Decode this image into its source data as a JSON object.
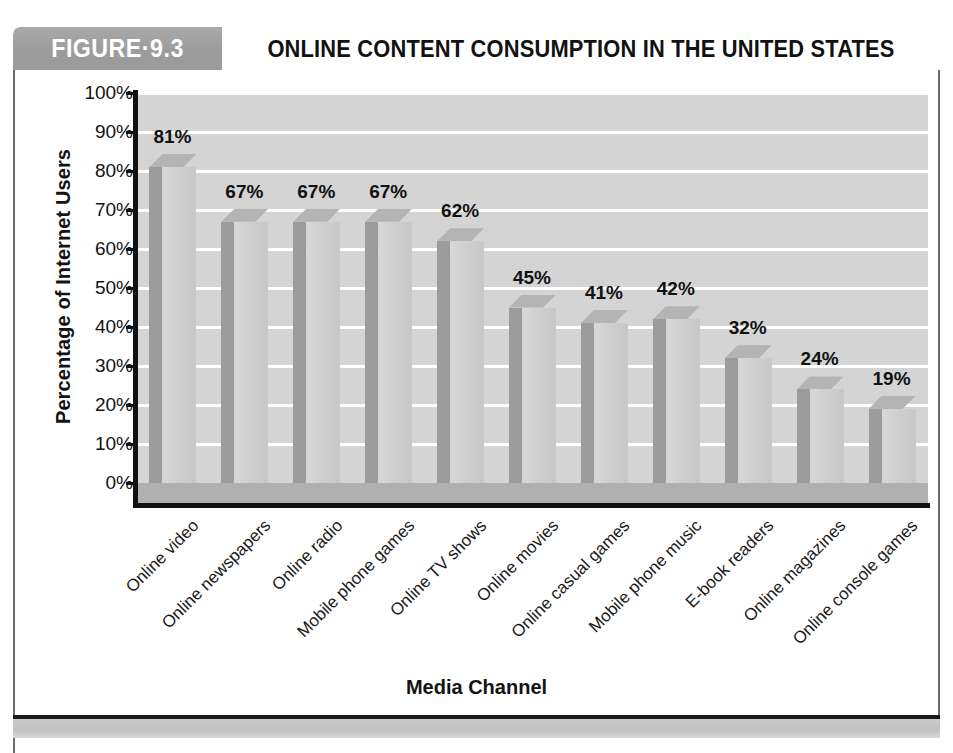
{
  "figure": {
    "number_label": "FIGURE·9.3",
    "title": "ONLINE CONTENT CONSUMPTION IN THE UNITED STATES"
  },
  "chart_data": {
    "type": "bar",
    "title": "ONLINE CONTENT CONSUMPTION IN THE UNITED STATES",
    "xlabel": "Media Channel",
    "ylabel": "Percentage of Internet Users",
    "ylim": [
      0,
      100
    ],
    "ytick_labels": [
      "100%",
      "90%",
      "80%",
      "70%",
      "60%",
      "50%",
      "40%",
      "30%",
      "20%",
      "10%",
      "0%"
    ],
    "ytick_values": [
      100,
      90,
      80,
      70,
      60,
      50,
      40,
      30,
      20,
      10,
      0
    ],
    "grid": true,
    "legend": false,
    "value_suffix": "%",
    "categories": [
      "Online video",
      "Online newspapers",
      "Online radio",
      "Mobile phone games",
      "Online TV shows",
      "Online movies",
      "Online casual games",
      "Mobile phone music",
      "E-book readers",
      "Online magazines",
      "Online console games"
    ],
    "values": [
      81,
      67,
      67,
      67,
      62,
      45,
      41,
      42,
      32,
      24,
      19
    ],
    "data_labels": [
      "81%",
      "67%",
      "67%",
      "67%",
      "62%",
      "45%",
      "41%",
      "42%",
      "32%",
      "24%",
      "19%"
    ],
    "colors": {
      "plot_background": "#d4d4d4",
      "gridline": "#ffffff",
      "bar_front": "#cfcfcf",
      "bar_side": "#9b9b9b",
      "bar_top": "#b4b4b4",
      "floor": "#b0b0b0",
      "axis": "#111111",
      "header_box": "#9c9c9c",
      "text": "#131313"
    }
  }
}
